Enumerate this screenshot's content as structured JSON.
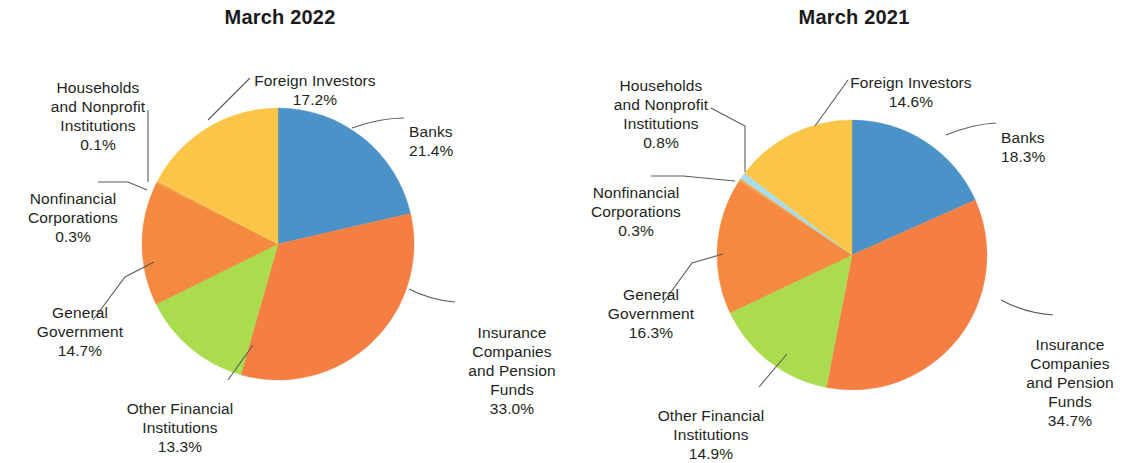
{
  "chart_data": [
    {
      "type": "pie",
      "title": "March 2022",
      "categories": [
        "Banks",
        "Insurance Companies and Pension Funds",
        "Other Financial Institutions",
        "General Government",
        "Nonfinancial Corporations",
        "Households and Nonprofit Institutions",
        "Foreign Investors"
      ],
      "values": [
        21.4,
        33.0,
        13.3,
        14.7,
        0.3,
        0.1,
        17.2
      ],
      "value_labels": [
        "21.4%",
        "33.0%",
        "13.3%",
        "14.7%",
        "0.3%",
        "0.1%",
        "17.2%"
      ],
      "colors": [
        "#4a92c8",
        "#f57f43",
        "#abdc4e",
        "#f4893f",
        "#f6a44a",
        "#f9d84e",
        "#fbc648"
      ],
      "xlabel": "",
      "ylabel": "",
      "legend": "labels-with-leader-lines",
      "start_angle_deg": 0,
      "direction": "clockwise"
    },
    {
      "type": "pie",
      "title": "March 2021",
      "categories": [
        "Banks",
        "Insurance Companies and Pension Funds",
        "Other Financial Institutions",
        "General Government",
        "Nonfinancial Corporations",
        "Households and Nonprofit Institutions",
        "Foreign Investors"
      ],
      "values": [
        18.3,
        34.7,
        14.9,
        16.3,
        0.3,
        0.8,
        14.6
      ],
      "value_labels": [
        "18.3%",
        "34.7%",
        "14.9%",
        "16.3%",
        "0.3%",
        "0.8%",
        "14.6%"
      ],
      "colors": [
        "#4a92c8",
        "#f57f43",
        "#abdc4e",
        "#f4893f",
        "#f6a44a",
        "#a9dcea",
        "#fbc648"
      ],
      "xlabel": "",
      "ylabel": "",
      "legend": "labels-with-leader-lines",
      "start_angle_deg": 0,
      "direction": "clockwise"
    }
  ],
  "left": {
    "title": "March 2022",
    "labels": {
      "foreign_investors": {
        "name": "Foreign Investors",
        "pct": "17.2%"
      },
      "banks": {
        "name": "Banks",
        "pct": "21.4%"
      },
      "insurance": {
        "name": "Insurance\nCompanies\nand Pension\nFunds",
        "pct": "33.0%"
      },
      "other_financial": {
        "name": "Other Financial\nInstitutions",
        "pct": "13.3%"
      },
      "general_government": {
        "name": "General\nGovernment",
        "pct": "14.7%"
      },
      "nonfinancial": {
        "name": "Nonfinancial\nCorporations",
        "pct": "0.3%"
      },
      "households": {
        "name": "Households\nand Nonprofit\nInstitutions",
        "pct": "0.1%"
      }
    }
  },
  "right": {
    "title": "March 2021",
    "labels": {
      "foreign_investors": {
        "name": "Foreign Investors",
        "pct": "14.6%"
      },
      "banks": {
        "name": "Banks",
        "pct": "18.3%"
      },
      "insurance": {
        "name": "Insurance\nCompanies\nand Pension\nFunds",
        "pct": "34.7%"
      },
      "other_financial": {
        "name": "Other Financial\nInstitutions",
        "pct": "14.9%"
      },
      "general_government": {
        "name": "General\nGovernment",
        "pct": "16.3%"
      },
      "nonfinancial": {
        "name": "Nonfinancial\nCorporations",
        "pct": "0.3%"
      },
      "households": {
        "name": "Households\nand Nonprofit\nInstitutions",
        "pct": "0.8%"
      }
    }
  },
  "style": {
    "leader_color": "#5a5a5a",
    "text_color": "#231f20"
  }
}
